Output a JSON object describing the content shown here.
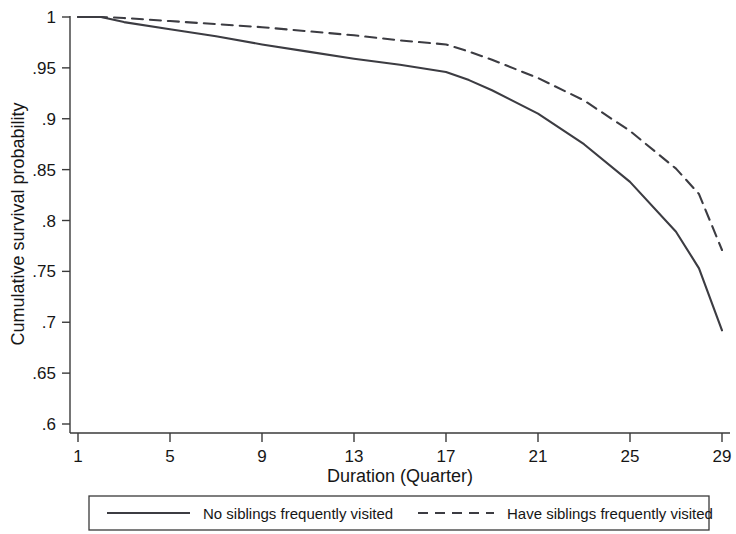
{
  "chart_data": {
    "type": "line",
    "title": "",
    "xlabel": "Duration (Quarter)",
    "ylabel": "Cumulative survival probability",
    "xlim": [
      1,
      29
    ],
    "ylim": [
      0.6,
      1.0
    ],
    "grid": false,
    "legend_position": "bottom-outside",
    "x_ticks": [
      "1",
      "5",
      "9",
      "13",
      "17",
      "21",
      "25",
      "29"
    ],
    "x_tick_values": [
      1,
      5,
      9,
      13,
      17,
      21,
      25,
      29
    ],
    "y_ticks": [
      ".6",
      ".65",
      ".7",
      ".75",
      ".8",
      ".85",
      ".9",
      ".95",
      "1"
    ],
    "y_tick_values": [
      0.6,
      0.65,
      0.7,
      0.75,
      0.8,
      0.85,
      0.9,
      0.95,
      1.0
    ],
    "line_color": "#3c3c42",
    "series": [
      {
        "name": "No siblings frequently visited",
        "style": "solid",
        "x": [
          1,
          2,
          3,
          5,
          7,
          9,
          11,
          13,
          15,
          17,
          18,
          19,
          21,
          23,
          25,
          27,
          28,
          29
        ],
        "values": [
          1.0,
          1.0,
          0.995,
          0.988,
          0.981,
          0.973,
          0.966,
          0.959,
          0.953,
          0.946,
          0.938,
          0.928,
          0.905,
          0.875,
          0.838,
          0.789,
          0.753,
          0.692
        ]
      },
      {
        "name": "Have siblings frequently visited",
        "style": "dashed",
        "x": [
          1,
          2,
          3,
          5,
          7,
          9,
          11,
          13,
          15,
          17,
          18,
          19,
          21,
          23,
          25,
          27,
          28,
          29
        ],
        "values": [
          1.0,
          1.0,
          0.999,
          0.996,
          0.993,
          0.99,
          0.986,
          0.982,
          0.977,
          0.973,
          0.966,
          0.958,
          0.94,
          0.918,
          0.888,
          0.851,
          0.826,
          0.771
        ]
      }
    ]
  },
  "legend": {
    "entries": [
      {
        "label": "No siblings frequently visited",
        "style": "solid"
      },
      {
        "label": "Have siblings frequently visited",
        "style": "dashed"
      }
    ]
  }
}
